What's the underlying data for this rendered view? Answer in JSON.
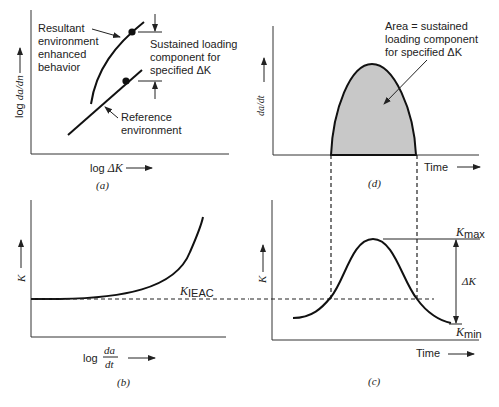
{
  "panels": {
    "a": {
      "caption": "(a)",
      "ylabel_prefix": "log ",
      "ylabel_var": "da/dn",
      "xlabel_prefix": "log ",
      "xlabel_var": "ΔK",
      "annotations": {
        "resultant": [
          "Resultant",
          "environment",
          "enhanced",
          "behavior"
        ],
        "sustained": [
          "Sustained loading",
          "component for",
          "specified ΔK"
        ],
        "reference": [
          "Reference",
          "environment"
        ]
      }
    },
    "b": {
      "caption": "(b)",
      "ylabel": "K",
      "xlabel_prefix": "log",
      "xlabel_num": "da",
      "xlabel_den": "dt",
      "threshold_label": "K",
      "threshold_sub": "IEAC"
    },
    "c": {
      "caption": "(c)",
      "ylabel": "K",
      "xlabel": "Time",
      "kmax_label": "K",
      "kmax_sub": "max",
      "kmin_label": "K",
      "kmin_sub": "min",
      "delta_label": "ΔK"
    },
    "d": {
      "caption": "(d)",
      "ylabel": "da/dt",
      "xlabel": "Time",
      "annotation": [
        "Area = sustained",
        "loading component",
        "for specified ΔK"
      ]
    }
  },
  "colors": {
    "shaded_area": "#c8c8c8",
    "line": "#111111"
  }
}
